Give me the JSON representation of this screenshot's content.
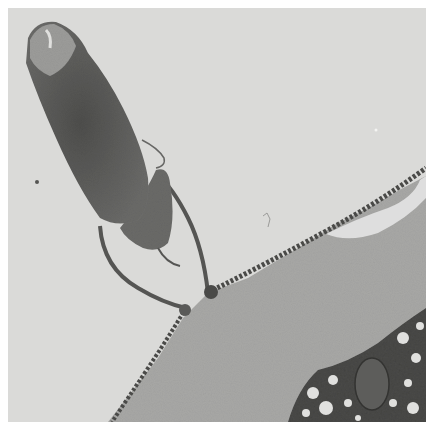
{
  "image": {
    "type": "transmission electron micrograph",
    "description": "Grayscale TEM showing an elongated dark organism body (upper left) attached by thin stalk-like membrane loops to a large gray granular cell with a beaded membrane border; dark vesiculated cytoplasm with an oval organelle at lower right",
    "colors": {
      "border": "#ffffff",
      "background": "#d9d9d7",
      "body_dark": "#5a5a58",
      "cell_gray": "#a9a9a7",
      "cytoplasm_dark": "#3e3e3c",
      "membrane": "#454543"
    }
  }
}
